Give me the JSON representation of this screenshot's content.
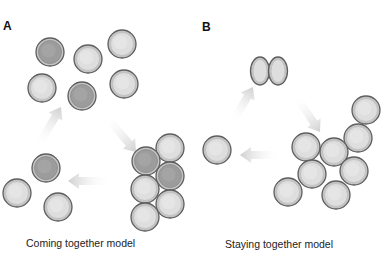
{
  "panels": [
    {
      "label": "A",
      "caption": "Coming together model",
      "cells": [
        {
          "cx": 50,
          "cy": 52,
          "shade": "dark"
        },
        {
          "cx": 88,
          "cy": 59,
          "shade": "light"
        },
        {
          "cx": 122,
          "cy": 44,
          "shade": "light"
        },
        {
          "cx": 42,
          "cy": 88,
          "shade": "light"
        },
        {
          "cx": 82,
          "cy": 96,
          "shade": "dark"
        },
        {
          "cx": 124,
          "cy": 84,
          "shade": "light"
        },
        {
          "cx": 170,
          "cy": 148,
          "shade": "light"
        },
        {
          "cx": 146,
          "cy": 161,
          "shade": "dark"
        },
        {
          "cx": 170,
          "cy": 176,
          "shade": "dark"
        },
        {
          "cx": 145,
          "cy": 189,
          "shade": "light"
        },
        {
          "cx": 170,
          "cy": 204,
          "shade": "light"
        },
        {
          "cx": 145,
          "cy": 217,
          "shade": "light"
        },
        {
          "cx": 46,
          "cy": 168,
          "shade": "dark"
        },
        {
          "cx": 17,
          "cy": 193,
          "shade": "light"
        },
        {
          "cx": 58,
          "cy": 207,
          "shade": "light"
        }
      ],
      "arrows": [
        {
          "x1": 38,
          "y1": 146,
          "x2": 61,
          "y2": 107
        },
        {
          "x1": 106,
          "y1": 116,
          "x2": 136,
          "y2": 152
        },
        {
          "x1": 110,
          "y1": 181,
          "x2": 68,
          "y2": 181
        }
      ]
    },
    {
      "label": "B",
      "caption": "Staying together model",
      "dividing_cell": {
        "cx": 269,
        "cy": 71
      },
      "cells": [
        {
          "cx": 366,
          "cy": 110,
          "shade": "light"
        },
        {
          "cx": 358,
          "cy": 138,
          "shade": "light"
        },
        {
          "cx": 306,
          "cy": 147,
          "shade": "light"
        },
        {
          "cx": 334,
          "cy": 152,
          "shade": "light"
        },
        {
          "cx": 312,
          "cy": 174,
          "shade": "light"
        },
        {
          "cx": 354,
          "cy": 171,
          "shade": "light"
        },
        {
          "cx": 288,
          "cy": 192,
          "shade": "light"
        },
        {
          "cx": 336,
          "cy": 195,
          "shade": "light"
        },
        {
          "cx": 217,
          "cy": 150,
          "shade": "light"
        }
      ],
      "arrows": [
        {
          "x1": 233,
          "y1": 122,
          "x2": 253,
          "y2": 87
        },
        {
          "x1": 296,
          "y1": 96,
          "x2": 320,
          "y2": 132
        },
        {
          "x1": 280,
          "y1": 155,
          "x2": 240,
          "y2": 155
        }
      ]
    }
  ],
  "colors": {
    "dark_fill": "#9c9c9c",
    "dark_inner": "#a8a8a8",
    "light_fill": "#dedede",
    "light_inner": "#e8e8e8",
    "outline": "#5e5e5e",
    "ring": "#c4c4c4",
    "arrow": "#d4d4d4"
  }
}
